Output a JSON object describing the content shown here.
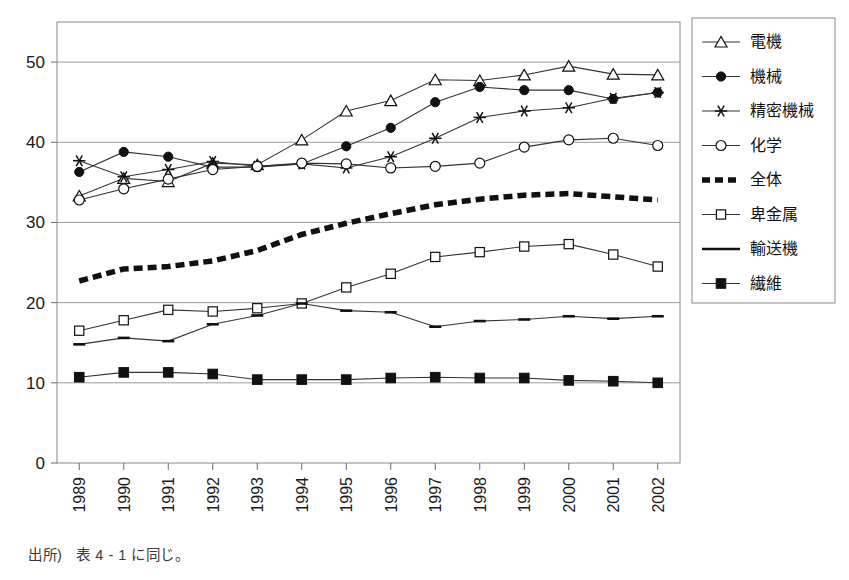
{
  "caption": {
    "source_label": "出所)",
    "source_text": "表 4 - 1 に同じ。"
  },
  "axes": {
    "y_ticks": [
      "0",
      "10",
      "20",
      "30",
      "40",
      "50"
    ],
    "x_ticks": [
      "1989",
      "1990",
      "1991",
      "1992",
      "1993",
      "1994",
      "1995",
      "1996",
      "1997",
      "1998",
      "1999",
      "2000",
      "2001",
      "2002"
    ]
  },
  "legend": {
    "position": "right",
    "items": [
      {
        "label": "電機",
        "marker": "triangle-open",
        "style": "solid"
      },
      {
        "label": "機械",
        "marker": "circle-filled",
        "style": "solid"
      },
      {
        "label": "精密機械",
        "marker": "asterisk",
        "style": "solid"
      },
      {
        "label": "化学",
        "marker": "circle-open",
        "style": "solid"
      },
      {
        "label": "全体",
        "marker": "none",
        "style": "thick-dashed"
      },
      {
        "label": "卑金属",
        "marker": "square-open",
        "style": "solid"
      },
      {
        "label": "輸送機",
        "marker": "dash",
        "style": "solid"
      },
      {
        "label": "繊維",
        "marker": "square-filled",
        "style": "solid"
      }
    ]
  },
  "chart_data": {
    "type": "line",
    "title": "",
    "xlabel": "",
    "ylabel": "",
    "ylim": [
      0,
      55
    ],
    "grid": true,
    "legend_position": "right",
    "categories": [
      "1989",
      "1990",
      "1991",
      "1992",
      "1993",
      "1994",
      "1995",
      "1996",
      "1997",
      "1998",
      "1999",
      "2000",
      "2001",
      "2002"
    ],
    "series": [
      {
        "name": "電機",
        "values": [
          33.3,
          35.5,
          35.1,
          37.4,
          37.2,
          40.3,
          43.9,
          45.2,
          47.8,
          47.7,
          48.4,
          49.5,
          48.5,
          48.4
        ]
      },
      {
        "name": "機械",
        "values": [
          36.3,
          38.8,
          38.2,
          36.9,
          36.9,
          37.3,
          39.5,
          41.8,
          45.0,
          46.9,
          46.5,
          46.5,
          45.4,
          46.2
        ]
      },
      {
        "name": "精密機械",
        "values": [
          37.7,
          35.7,
          36.6,
          37.6,
          37.0,
          37.3,
          36.8,
          38.2,
          40.5,
          43.1,
          43.9,
          44.3,
          45.5,
          46.2
        ]
      },
      {
        "name": "化学",
        "values": [
          32.8,
          34.2,
          35.4,
          36.6,
          37.0,
          37.4,
          37.3,
          36.8,
          37.0,
          37.4,
          39.4,
          40.3,
          40.5,
          39.6
        ]
      },
      {
        "name": "全体",
        "values": [
          22.7,
          24.2,
          24.5,
          25.2,
          26.5,
          28.5,
          29.9,
          31.1,
          32.2,
          32.9,
          33.4,
          33.6,
          33.2,
          32.8
        ]
      },
      {
        "name": "卑金属",
        "values": [
          16.5,
          17.8,
          19.1,
          18.9,
          19.3,
          19.9,
          21.9,
          23.6,
          25.7,
          26.3,
          27.0,
          27.3,
          26.0,
          24.5
        ]
      },
      {
        "name": "輸送機",
        "values": [
          14.8,
          15.6,
          15.2,
          17.3,
          18.4,
          19.9,
          19.0,
          18.8,
          17.0,
          17.7,
          17.9,
          18.3,
          18.0,
          18.3
        ]
      },
      {
        "name": "繊維",
        "values": [
          10.7,
          11.3,
          11.3,
          11.1,
          10.4,
          10.4,
          10.4,
          10.6,
          10.7,
          10.6,
          10.6,
          10.3,
          10.2,
          10.0
        ]
      }
    ]
  }
}
